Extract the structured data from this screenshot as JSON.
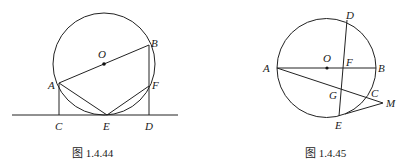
{
  "figures": [
    {
      "id": "fig-1-4-44",
      "caption": "图 1.4.44",
      "labels": {
        "O": "O",
        "A": "A",
        "B": "B",
        "C": "C",
        "D": "D",
        "E": "E",
        "F": "F"
      },
      "description": "Circle with center O, diameter AB; line CED tangent to circle at E; AC and BD perpendicular to the line; F on BD and circle; segments AE and EF drawn."
    },
    {
      "id": "fig-1-4-45",
      "caption": "图 1.4.45",
      "labels": {
        "O": "O",
        "A": "A",
        "B": "B",
        "C": "C",
        "D": "D",
        "E": "E",
        "F": "F",
        "G": "G",
        "M": "M"
      },
      "description": "Circle with center O, diameter AB; chord DE crosses AB at F; secant from A through G and C meets M outside circle; ME tangent to circle at E."
    }
  ]
}
